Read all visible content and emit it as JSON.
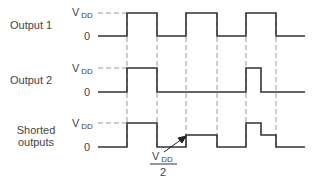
{
  "diagram": {
    "title": "",
    "rows": [
      {
        "label": "Output 1",
        "high_label": "V",
        "high_sub": "DD",
        "low_label": "0"
      },
      {
        "label": "Output 2",
        "high_label": "V",
        "high_sub": "DD",
        "low_label": "0"
      },
      {
        "label_line1": "Shorted",
        "label_line2": "outputs",
        "high_label": "V",
        "high_sub": "DD",
        "low_label": "0"
      }
    ],
    "annotation": {
      "numerator": "V",
      "numerator_sub": "DD",
      "denominator": "2"
    },
    "colors": {
      "trace": "#333333",
      "guide": "#999999"
    }
  }
}
